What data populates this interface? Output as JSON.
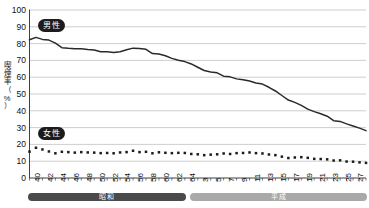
{
  "chart_data": {
    "type": "line",
    "title": "",
    "xlabel": "",
    "ylabel": "喫煙率（%）",
    "ylim": [
      0,
      100
    ],
    "ytick_values": [
      0,
      10,
      20,
      30,
      40,
      50,
      60,
      70,
      80,
      90,
      100
    ],
    "grid": true,
    "legend_position": "inline-annotations",
    "x": [
      "昭和40",
      "昭和41",
      "昭和42",
      "昭和43",
      "昭和44",
      "昭和45",
      "昭和46",
      "昭和47",
      "昭和48",
      "昭和49",
      "昭和50",
      "昭和51",
      "昭和52",
      "昭和53",
      "昭和54",
      "昭和55",
      "昭和56",
      "昭和57",
      "昭和58",
      "昭和59",
      "昭和60",
      "昭和61",
      "昭和62",
      "昭和63",
      "昭和64",
      "平成2",
      "平成3",
      "平成4",
      "平成5",
      "平成6",
      "平成7",
      "平成8",
      "平成9",
      "平成10",
      "平成11",
      "平成12",
      "平成13",
      "平成14",
      "平成15",
      "平成16",
      "平成17",
      "平成18",
      "平成19",
      "平成20",
      "平成21",
      "平成22",
      "平成23",
      "平成24",
      "平成25",
      "平成26",
      "平成27",
      "平成28",
      "平成29"
    ],
    "xtick_labels": [
      "40",
      "42",
      "44",
      "46",
      "48",
      "50",
      "52",
      "54",
      "56",
      "58",
      "60",
      "62",
      "64",
      "3",
      "5",
      "7",
      "9",
      "11",
      "13",
      "15",
      "17",
      "19",
      "21",
      "23",
      "25",
      "27",
      "29"
    ],
    "xtick_indices": [
      0,
      2,
      4,
      6,
      8,
      10,
      12,
      14,
      16,
      18,
      20,
      22,
      24,
      26,
      28,
      30,
      32,
      34,
      36,
      38,
      40,
      42,
      44,
      46,
      48,
      50,
      52
    ],
    "series": [
      {
        "name": "男性",
        "style": "solid-line",
        "color": "#2a2a2a",
        "values": [
          82.3,
          83.7,
          82.5,
          82.1,
          80.3,
          77.6,
          77.2,
          77.0,
          76.9,
          76.5,
          76.2,
          75.1,
          75.1,
          74.7,
          75.2,
          76.3,
          77.3,
          77.1,
          76.6,
          74.1,
          73.8,
          72.8,
          71.2,
          70.1,
          69.3,
          67.9,
          65.9,
          64.0,
          63.1,
          62.6,
          60.6,
          60.2,
          59.0,
          58.5,
          57.7,
          56.6,
          55.9,
          54.0,
          51.8,
          49.1,
          46.4,
          45.0,
          43.2,
          41.0,
          39.5,
          38.2,
          36.8,
          34.1,
          33.7,
          32.2,
          31.0,
          29.7,
          28.2
        ]
      },
      {
        "name": "女性",
        "style": "dotted-markers",
        "color": "#1c1c1c",
        "values": [
          15.7,
          18.0,
          17.0,
          15.8,
          14.7,
          15.6,
          15.4,
          15.1,
          15.4,
          15.2,
          15.1,
          14.8,
          14.9,
          14.7,
          15.2,
          15.4,
          16.2,
          15.4,
          15.6,
          14.7,
          15.3,
          15.0,
          14.8,
          15.0,
          14.9,
          14.3,
          14.1,
          13.6,
          13.9,
          14.1,
          14.6,
          14.3,
          14.8,
          14.9,
          15.2,
          14.8,
          14.6,
          14.0,
          13.6,
          12.7,
          11.9,
          12.2,
          12.4,
          12.0,
          11.4,
          11.3,
          11.1,
          10.4,
          10.5,
          9.8,
          9.7,
          9.3,
          9.0
        ]
      }
    ],
    "era_bands": [
      {
        "label": "昭和",
        "start_index": 0,
        "end_index": 24,
        "color": "#4a4a4a"
      },
      {
        "label": "平成",
        "start_index": 25,
        "end_index": 52,
        "color": "#a9a9a9"
      }
    ],
    "annotations": [
      {
        "text": "男性",
        "series": "male"
      },
      {
        "text": "女性",
        "series": "female"
      }
    ]
  },
  "axis": {
    "y_title": "喫煙率（%）",
    "y_title_chars": [
      "喫",
      "煙",
      "率",
      "（",
      "%",
      "）"
    ]
  }
}
